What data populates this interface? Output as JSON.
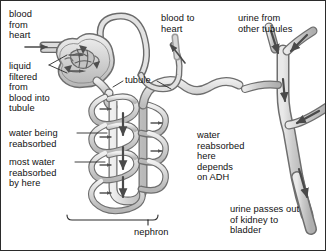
{
  "figure": {
    "width": 326,
    "height": 251,
    "background": "#ffffff",
    "border_color": "#2b2b2b"
  },
  "colors": {
    "outline": "#5a5a5a",
    "tubule_fill": "#d9d9d9",
    "tubule_fill_light": "#e6e6e6",
    "capillary_fill": "#cfcfcf",
    "duct_fill": "#c9c9c9",
    "duct_fill_light": "#dedede",
    "arrow": "#4a4a4a",
    "text": "#111111",
    "leader": "#2b2b2b"
  },
  "labels": {
    "blood_from_heart": "blood\nfrom\nheart",
    "liquid_filtered": "liquid\nfiltered\nfrom\nblood into\ntubule",
    "water_being_reabsorbed": "water being\nreabsorbed",
    "most_water": "most water\nreabsorbed\nby here",
    "tubule": "tubule",
    "blood_to_heart": "blood to\nheart",
    "urine_from_other_tubules": "urine from\nother tubules",
    "water_reabsorbed_adh": "water\nreabsorbed\nhere\ndepends\non ADH",
    "urine_passes_out": "urine passes out\nof kidney to\nbladder",
    "nephron": "nephron"
  },
  "label_positions": {
    "blood_from_heart": {
      "x": 8,
      "y": 8
    },
    "liquid_filtered": {
      "x": 8,
      "y": 60
    },
    "water_being_reabsorbed": {
      "x": 8,
      "y": 127
    },
    "most_water": {
      "x": 8,
      "y": 156
    },
    "tubule": {
      "x": 124,
      "y": 77
    },
    "blood_to_heart": {
      "x": 160,
      "y": 12
    },
    "urine_from_other_tubules": {
      "x": 237,
      "y": 12
    },
    "water_reabsorbed_adh": {
      "x": 196,
      "y": 129
    },
    "urine_passes_out": {
      "x": 229,
      "y": 203
    },
    "nephron": {
      "x": 133,
      "y": 226
    }
  },
  "structures": [
    {
      "name": "afferent-arteriole",
      "description": "blood vessel entering from left toward glomerulus"
    },
    {
      "name": "glomerulus",
      "description": "knot of capillaries inside Bowman's capsule"
    },
    {
      "name": "bowmans-capsule",
      "description": "cup surrounding the glomerulus where filtration occurs"
    },
    {
      "name": "efferent-arteriole",
      "description": "blood vessel leaving glomerulus, loops over top"
    },
    {
      "name": "proximal-tubule",
      "description": "coiled tubule descending from Bowman's capsule"
    },
    {
      "name": "loop-of-henle",
      "description": "long hairpin loop of the tubule"
    },
    {
      "name": "peritubular-capillary",
      "description": "capillary coiling around the tubule"
    },
    {
      "name": "distal-tubule",
      "description": "tubule ascending and curving right to collecting duct"
    },
    {
      "name": "collecting-duct",
      "description": "vertical duct on right receiving urine from tubules"
    },
    {
      "name": "duct-branch-upper-left",
      "description": "branch of collecting duct from other tubules"
    },
    {
      "name": "duct-branch-upper-right",
      "description": "branch of collecting duct from other tubules"
    },
    {
      "name": "duct-branch-lower-right",
      "description": "branch of collecting duct from other tubules"
    },
    {
      "name": "ureter",
      "description": "duct leaving bottom of kidney toward bladder"
    },
    {
      "name": "nephron-bracket",
      "description": "horizontal bracket spanning the nephron"
    }
  ],
  "flow_arrows": [
    {
      "name": "arrow-blood-in",
      "direction": "right",
      "meaning": "blood from heart entering"
    },
    {
      "name": "arrow-filtration-upper",
      "direction": "right",
      "meaning": "liquid filtered from blood into tubule"
    },
    {
      "name": "arrow-filtration-lower",
      "direction": "right",
      "meaning": "liquid filtered from blood into tubule"
    },
    {
      "name": "arrow-blood-out",
      "direction": "up-left",
      "meaning": "blood returning to heart"
    },
    {
      "name": "arrow-water-reabsorb-1",
      "direction": "right",
      "meaning": "water being reabsorbed"
    },
    {
      "name": "arrow-water-reabsorb-2",
      "direction": "right",
      "meaning": "water being reabsorbed"
    },
    {
      "name": "arrow-water-reabsorb-3",
      "direction": "right",
      "meaning": "water being reabsorbed"
    },
    {
      "name": "arrow-water-reabsorb-4",
      "direction": "right",
      "meaning": "water being reabsorbed"
    },
    {
      "name": "arrow-water-reabsorb-5",
      "direction": "right",
      "meaning": "water reabsorbed depends on ADH"
    },
    {
      "name": "arrow-water-reabsorb-6",
      "direction": "right",
      "meaning": "water reabsorbed depends on ADH"
    },
    {
      "name": "arrow-filtrate-down-1",
      "direction": "down",
      "meaning": "filtrate flowing down tubule"
    },
    {
      "name": "arrow-filtrate-down-2",
      "direction": "down",
      "meaning": "filtrate flowing down tubule"
    },
    {
      "name": "arrow-filtrate-down-3",
      "direction": "down",
      "meaning": "filtrate flowing down tubule"
    },
    {
      "name": "arrow-urine-branch-left",
      "direction": "down",
      "meaning": "urine from other tubules"
    },
    {
      "name": "arrow-urine-branch-right",
      "direction": "down-left",
      "meaning": "urine from other tubules"
    },
    {
      "name": "arrow-urine-branch-lower",
      "direction": "left",
      "meaning": "urine from other tubules"
    },
    {
      "name": "arrow-urine-in-duct",
      "direction": "down",
      "meaning": "urine flowing down collecting duct"
    },
    {
      "name": "arrow-urine-out",
      "direction": "down",
      "meaning": "urine passes out of kidney to bladder"
    }
  ]
}
